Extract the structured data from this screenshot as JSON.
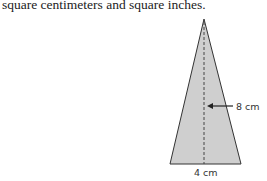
{
  "text": {
    "intro": "square centimeters and square inches."
  },
  "figure": {
    "shape": "isosceles triangle",
    "fill_color": "#cfcfcf",
    "stroke_color": "#333333",
    "height_label": "8 cm",
    "base_label": "4 cm"
  }
}
